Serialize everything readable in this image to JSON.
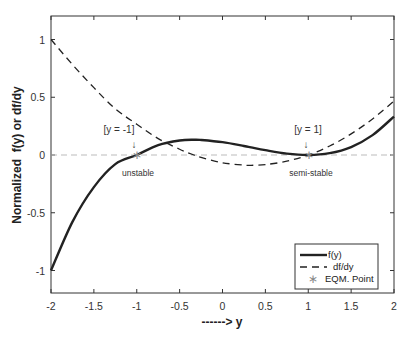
{
  "chart_data": {
    "type": "line",
    "title": "",
    "xlabel": "------> y",
    "ylabel": "Normalized  f(y) or df/dy",
    "xlim": [
      -2,
      2
    ],
    "ylim": [
      -1.2,
      1.2
    ],
    "xticks": [
      -2,
      -1.5,
      -1,
      -0.5,
      0,
      0.5,
      1,
      1.5,
      2
    ],
    "xtick_labels": [
      "-2",
      "-1.5",
      "-1",
      "-0.5",
      "0",
      "0.5",
      "1",
      "1.5",
      "2"
    ],
    "yticks": [
      -1,
      -0.5,
      0,
      0.5,
      1
    ],
    "ytick_labels": [
      "-1",
      "-0.5",
      "0",
      "0.5",
      "1"
    ],
    "grid": false,
    "legend_position": "lower right",
    "x": [
      -2,
      -1.75,
      -1.5,
      -1.25,
      -1,
      -0.75,
      -0.5,
      -0.333,
      -0.25,
      0,
      0.25,
      0.333,
      0.5,
      0.75,
      1,
      1.25,
      1.5,
      1.75,
      2
    ],
    "series": [
      {
        "name": "f(y)",
        "style": "solid",
        "color": "#222222",
        "values": [
          -1.0,
          -0.579,
          -0.278,
          -0.079,
          0.0,
          0.085,
          0.125,
          0.132,
          0.13,
          0.111,
          0.078,
          0.066,
          0.042,
          0.012,
          0.0,
          0.016,
          0.069,
          0.172,
          0.333
        ]
      },
      {
        "name": "df/dy",
        "style": "dashed",
        "color": "#222222",
        "values": [
          1.0,
          0.783,
          0.583,
          0.4,
          0.267,
          0.142,
          0.05,
          0.0,
          -0.021,
          -0.067,
          -0.088,
          -0.089,
          -0.083,
          -0.054,
          0.0,
          0.078,
          0.183,
          0.312,
          0.467
        ]
      },
      {
        "name": "EQM. Point",
        "style": "marker-asterisk",
        "color": "#888888",
        "points": [
          [
            -1,
            0
          ],
          [
            1,
            0
          ]
        ]
      }
    ],
    "reference_lines": [
      {
        "type": "horizontal",
        "y": 0,
        "style": "dashed",
        "color": "#bbbbbb"
      }
    ],
    "annotations": [
      {
        "text": "[y = -1]",
        "x": -1,
        "y": 0.2,
        "arrow": "down"
      },
      {
        "text": "unstable",
        "x": -1,
        "y": -0.1
      },
      {
        "text": "[y = 1]",
        "x": 1,
        "y": 0.2,
        "arrow": "down"
      },
      {
        "text": "semi-stable",
        "x": 1,
        "y": -0.1
      }
    ],
    "legend": [
      "f(y)",
      "df/dy",
      "EQM. Point"
    ]
  },
  "annotations_text": {
    "left_label": "[y = -1]",
    "left_state": "unstable",
    "right_label": "[y = 1]",
    "right_state": "semi-stable",
    "arrow": "↓"
  },
  "legend": {
    "items": [
      "f(y)",
      "df/dy",
      "EQM. Point"
    ],
    "marker": "∗"
  },
  "colors": {
    "curve": "#222222",
    "zero_line": "#bbbbbb",
    "eqm_marker": "#888888",
    "axes": "#333333"
  }
}
